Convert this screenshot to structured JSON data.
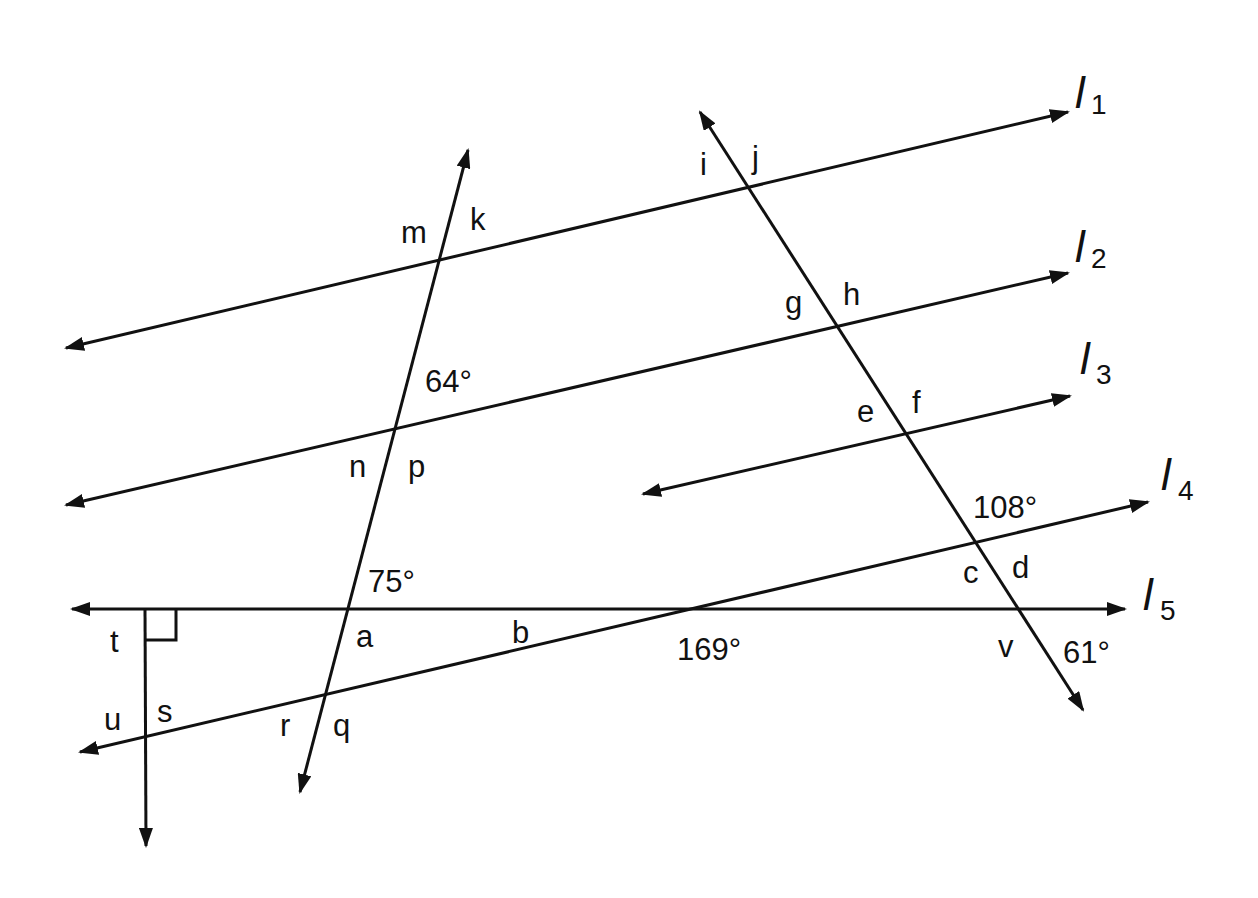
{
  "diagram": {
    "colors": {
      "ink": "#111111",
      "background": "#ffffff"
    },
    "line_names": [
      {
        "id": "l1",
        "letter": "l",
        "sub": "1"
      },
      {
        "id": "l2",
        "letter": "l",
        "sub": "2"
      },
      {
        "id": "l3",
        "letter": "l",
        "sub": "3"
      },
      {
        "id": "l4",
        "letter": "l",
        "sub": "4"
      },
      {
        "id": "l5",
        "letter": "l",
        "sub": "5"
      }
    ],
    "angle_letters": {
      "i": "i",
      "j": "j",
      "k": "k",
      "m": "m",
      "g": "g",
      "h": "h",
      "e": "e",
      "f": "f",
      "n": "n",
      "p": "p",
      "a": "a",
      "b": "b",
      "c": "c",
      "d": "d",
      "v": "v",
      "t": "t",
      "u": "u",
      "s": "s",
      "r": "r",
      "q": "q"
    },
    "angle_measures": {
      "deg64": "64°",
      "deg75": "75°",
      "deg108": "108°",
      "deg169": "169°",
      "deg61": "61°"
    },
    "right_angle_marker": "right-angle at l5 and vertical transversal"
  }
}
